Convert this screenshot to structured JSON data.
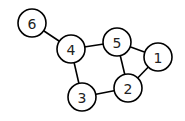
{
  "graph": {
    "nodes": [
      {
        "id": "1",
        "label": "1",
        "x": 158,
        "y": 57
      },
      {
        "id": "2",
        "label": "2",
        "x": 128,
        "y": 88
      },
      {
        "id": "3",
        "label": "3",
        "x": 82,
        "y": 97
      },
      {
        "id": "4",
        "label": "4",
        "x": 71,
        "y": 49
      },
      {
        "id": "5",
        "label": "5",
        "x": 117,
        "y": 42
      },
      {
        "id": "6",
        "label": "6",
        "x": 32,
        "y": 23
      }
    ],
    "edges": [
      {
        "from": "6",
        "to": "4"
      },
      {
        "from": "4",
        "to": "5"
      },
      {
        "from": "4",
        "to": "3"
      },
      {
        "from": "3",
        "to": "2"
      },
      {
        "from": "5",
        "to": "2"
      },
      {
        "from": "5",
        "to": "1"
      },
      {
        "from": "1",
        "to": "2"
      }
    ],
    "node_radius": 14,
    "colors": {
      "stroke": "#000000",
      "fill": "#ffffff",
      "label": "#222222"
    }
  }
}
